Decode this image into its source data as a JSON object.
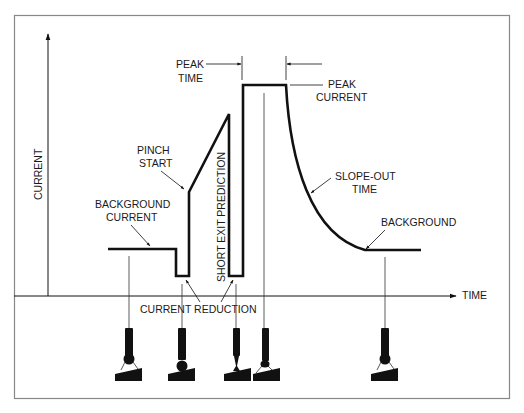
{
  "diagram": {
    "axes": {
      "y_label": "CURRENT",
      "x_label": "TIME"
    },
    "labels": {
      "peak_time_1": "PEAK",
      "peak_time_2": "TIME",
      "peak_current_1": "PEAK",
      "peak_current_2": "CURRENT",
      "pinch_start_1": "PINCH",
      "pinch_start_2": "START",
      "background_current_1": "BACKGROUND",
      "background_current_2": "CURRENT",
      "short_exit_prediction": "SHORT EXIT PREDICTION",
      "slope_out_1": "SLOPE-OUT",
      "slope_out_2": "TIME",
      "background": "BACKGROUND",
      "current_reduction": "CURRENT REDUCTION"
    },
    "colors": {
      "line": "#111111",
      "frame": "#888888",
      "background": "#ffffff"
    },
    "electrode_stages": [
      {
        "name": "droplet-forming",
        "x": 118
      },
      {
        "name": "droplet-contact",
        "x": 183
      },
      {
        "name": "neck-pinch",
        "x": 236
      },
      {
        "name": "arc-reignite",
        "x": 265
      },
      {
        "name": "droplet-growth",
        "x": 385
      }
    ]
  }
}
